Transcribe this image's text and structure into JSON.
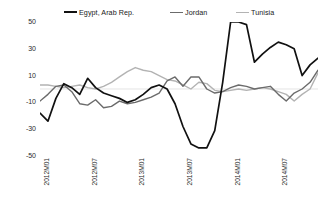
{
  "chart_data": {
    "type": "line",
    "title": "",
    "xlabel": "",
    "ylabel": "",
    "ylim": [
      -50,
      50
    ],
    "yticks": [
      50,
      30,
      10,
      -10,
      -30,
      -50
    ],
    "grid": false,
    "zero_line": true,
    "legend_position": "top",
    "x": [
      "2012M01",
      "2012M02",
      "2012M03",
      "2012M04",
      "2012M05",
      "2012M06",
      "2012M07",
      "2012M08",
      "2012M09",
      "2012M10",
      "2012M11",
      "2012M12",
      "2013M01",
      "2013M02",
      "2013M03",
      "2013M04",
      "2013M05",
      "2013M06",
      "2013M07",
      "2013M08",
      "2013M09",
      "2013M10",
      "2013M11",
      "2013M12",
      "2014M01",
      "2014M02",
      "2014M03",
      "2014M04",
      "2014M05",
      "2014M06",
      "2014M07",
      "2014M08",
      "2014M09",
      "2014M10",
      "2014M11",
      "2014M12"
    ],
    "xticks": [
      "2012M01",
      "2012M07",
      "2013M01",
      "2013M07",
      "2014M01",
      "2014M07"
    ],
    "xtick_index": [
      0,
      6,
      12,
      18,
      24,
      30
    ],
    "series": [
      {
        "name": "Egypt, Arab Rep.",
        "color": "#111111",
        "width": 1.7,
        "values": [
          -18,
          -24,
          -7,
          4,
          1,
          -4,
          8,
          1,
          -3,
          -5,
          -7,
          -10,
          -8,
          -4,
          1,
          3,
          0,
          -11,
          -28,
          -41,
          -44,
          -44,
          -31,
          5,
          50,
          50,
          48,
          20,
          26,
          31,
          35,
          33,
          30,
          10,
          18,
          23
        ]
      },
      {
        "name": "Jordan",
        "color": "#6b6b6b",
        "width": 1.4,
        "values": [
          -9,
          -4,
          2,
          3,
          -2,
          -11,
          -12,
          -8,
          -14,
          -13,
          -9,
          -11,
          -10,
          -8,
          -6,
          -3,
          6,
          9,
          2,
          9,
          9,
          0,
          -3,
          -2,
          1,
          3,
          2,
          0,
          1,
          2,
          -4,
          -9,
          -3,
          0,
          5,
          14
        ]
      },
      {
        "name": "Tunisia",
        "color": "#b3b3b3",
        "width": 1.4,
        "values": [
          3,
          3,
          2,
          1,
          2,
          3,
          1,
          0,
          2,
          5,
          9,
          13,
          16,
          14,
          13,
          10,
          7,
          6,
          3,
          0,
          5,
          4,
          -1,
          -2,
          -1,
          0,
          -1,
          0,
          1,
          0,
          -2,
          -4,
          -9,
          -4,
          0,
          12
        ]
      }
    ]
  },
  "legend": {
    "items": [
      {
        "label": "Egypt, Arab Rep.",
        "color": "#111111"
      },
      {
        "label": "Jordan",
        "color": "#6b6b6b"
      },
      {
        "label": "Tunisia",
        "color": "#b3b3b3"
      }
    ]
  },
  "axis": {
    "y_labels": [
      "50",
      "30",
      "10",
      "-10",
      "-30",
      "-50"
    ],
    "x_labels": [
      "2012M01",
      "2012M07",
      "2013M01",
      "2013M07",
      "2014M01",
      "2014M07"
    ]
  }
}
